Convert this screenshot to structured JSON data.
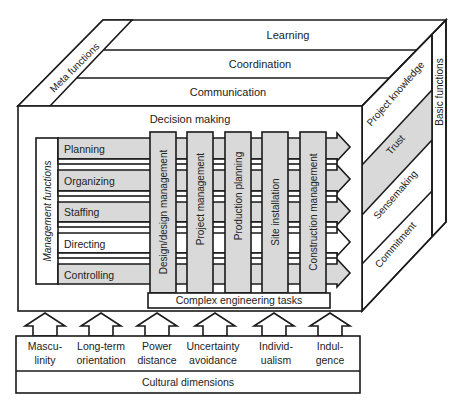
{
  "colors": {
    "line": "#1a1a1a",
    "gray_fill": "#d9d9d9",
    "white_fill": "#ffffff",
    "text": "#222222"
  },
  "top_layers": [
    {
      "label": "Learning"
    },
    {
      "label": "Coordination"
    },
    {
      "label": "Communication"
    }
  ],
  "meta_functions": {
    "label": "Meta functions"
  },
  "decision_making": {
    "label": "Decision making"
  },
  "management_functions": {
    "title": "Management functions",
    "items": [
      {
        "label": "Planning",
        "fill": "gray"
      },
      {
        "label": "Organizing",
        "fill": "gray"
      },
      {
        "label": "Staffing",
        "fill": "gray"
      },
      {
        "label": "Directing",
        "fill": "white"
      },
      {
        "label": "Controlling",
        "fill": "gray"
      }
    ]
  },
  "engineering_columns": [
    {
      "label": "Design/design management"
    },
    {
      "label": "Project management"
    },
    {
      "label": "Production planning"
    },
    {
      "label": "Site installation"
    },
    {
      "label": "Construction management"
    }
  ],
  "complex_engineering_tasks": {
    "label": "Complex engineering tasks"
  },
  "side_layers": [
    {
      "label": "Project knowledge",
      "fill": "white"
    },
    {
      "label": "Trust",
      "fill": "gray"
    },
    {
      "label": "Sensemaking",
      "fill": "white"
    },
    {
      "label": "Commitment",
      "fill": "white"
    }
  ],
  "basic_functions": {
    "label": "Basic functions"
  },
  "cultural_dimensions": {
    "title": "Cultural dimensions",
    "items": [
      {
        "line1": "Mascu-",
        "line2": "linity"
      },
      {
        "line1": "Long-term",
        "line2": "orientation"
      },
      {
        "line1": "Power",
        "line2": "distance"
      },
      {
        "line1": "Uncertainty",
        "line2": "avoidance"
      },
      {
        "line1": "Individ-",
        "line2": "ualism"
      },
      {
        "line1": "Indul-",
        "line2": "gence"
      }
    ]
  }
}
